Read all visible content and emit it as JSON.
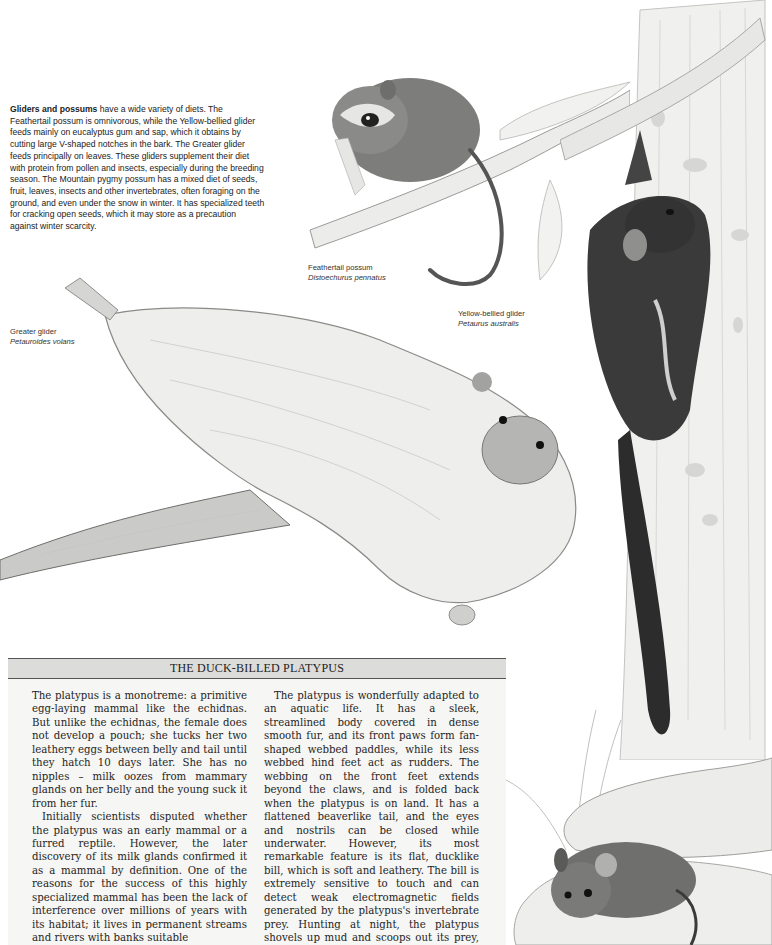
{
  "intro": {
    "lead": "Gliders and possums",
    "text": " have a wide variety of diets. The Feathertail possum is omnivorous, while the Yellow-bellied glider feeds mainly on eucalyptus gum and sap, which it obtains by cutting large V-shaped notches in the bark. The Greater glider feeds principally on leaves. These gliders supplement their diet with protein from pollen and insects, especially during the breeding season. The Mountain pygmy possum has a mixed diet of seeds, fruit, leaves, insects and other invertebrates, often foraging on the ground, and even under the snow in winter. It has specialized teeth for cracking open seeds, which it may store as a precaution against winter scarcity."
  },
  "labels": {
    "feathertail": {
      "common": "Feathertail possum",
      "latin": "Distoechurus pennatus"
    },
    "yellow_bellied": {
      "common": "Yellow-bellied glider",
      "latin": "Petaurus australis"
    },
    "greater": {
      "common": "Greater glider",
      "latin": "Petauroides volans"
    }
  },
  "illustrations": {
    "feathertail": "feathertail-possum-on-branch",
    "yellow_bellied": "yellow-bellied-glider-on-tree-trunk",
    "greater": "greater-glider-gliding",
    "pygmy": "mountain-pygmy-possum-under-rock"
  },
  "platypus_box": {
    "title": "THE DUCK-BILLED PLATYPUS",
    "col1": [
      "The platypus is a monotreme: a primitive egg-laying mammal like the echidnas. But unlike the echidnas, the female does not develop a pouch; she tucks her two leathery eggs between belly and tail until they hatch 10 days later. She has no nipples – milk oozes from mammary glands on her belly and the young suck it from her fur.",
      "Initially scientists disputed whether the platypus was an early mammal or a furred reptile. However, the later discovery of its milk glands confirmed it as a mammal by definition. One of the reasons for the success of this highly specialized mammal has been the lack of interference over millions of years with its habitat; it lives in permanent streams and rivers with banks suitable"
    ],
    "col2": [
      "The platypus is wonderfully adapted to an aquatic life. It has a sleek, streamlined body covered in dense smooth fur, and its front paws form fan-shaped webbed paddles, while its less webbed hind feet act as rudders. The webbing on the front feet extends beyond the claws, and is folded back when the platypus is on land. It has a flattened beaverlike tail, and the eyes and nostrils can be closed while underwater. However, its most remarkable feature is its flat, ducklike bill, which is soft and leathery. The bill is extremely sensitive to touch and can detect weak electromagnetic fields generated by the platypus's invertebrate prey. Hunting at night, the platypus shovels up mud and scoops out its prey, which it stores in"
    ]
  },
  "colors": {
    "box_bg": "#f6f6f4",
    "header_bg": "#dcdcda",
    "rule": "#555555",
    "text": "#1e1e1e"
  }
}
